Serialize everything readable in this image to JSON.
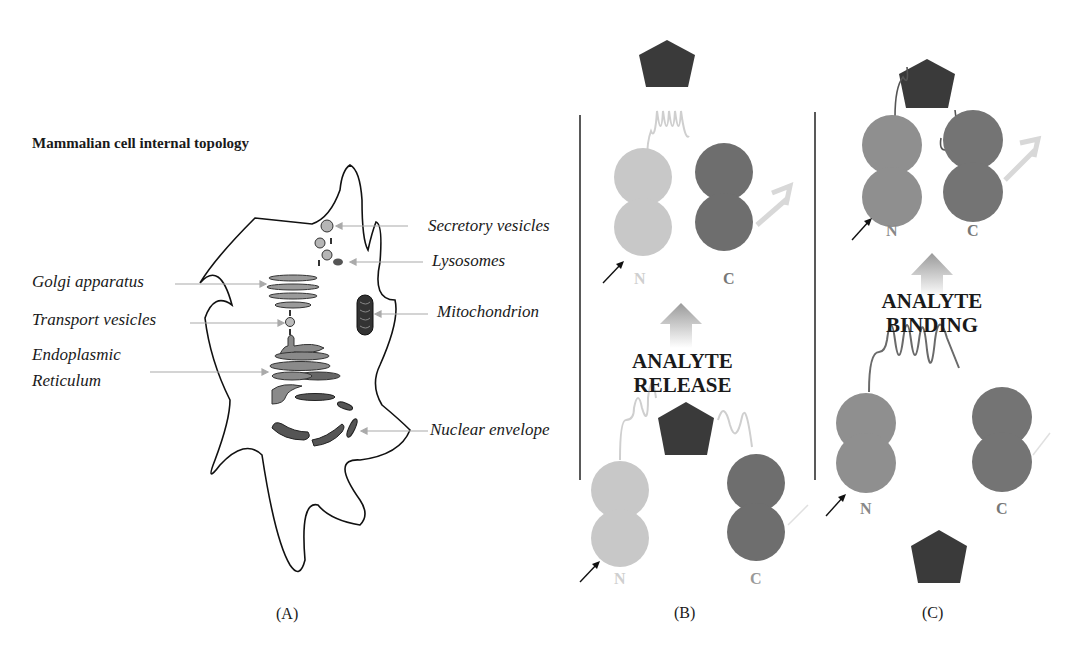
{
  "panel_a": {
    "title": "Mammalian cell internal topology",
    "caption": "(A)",
    "labels_left": [
      "Golgi apparatus",
      "Transport vesicles",
      "Endoplasmic",
      "Reticulum"
    ],
    "labels_right": [
      "Secretory vesicles",
      "Lysosomes",
      "Mitochondrion",
      "Nuclear envelope"
    ]
  },
  "panel_b": {
    "caption": "(B)",
    "event_line1": "ANALYTE",
    "event_line2": "RELEASE",
    "top": {
      "n_label": "N",
      "c_label": "C"
    },
    "bottom": {
      "n_label": "N",
      "c_label": "C"
    }
  },
  "panel_c": {
    "caption": "(C)",
    "event_line1": "ANALYTE",
    "event_line2": "BINDING",
    "top": {
      "n_label": "N",
      "c_label": "C"
    },
    "bottom": {
      "n_label": "N",
      "c_label": "C"
    }
  },
  "colors": {
    "analyte": "#3a3a3a",
    "n_light": "#c8c8c8",
    "n_mid": "#8f8f8f",
    "c_dark": "#6e6e6e",
    "linker_light": "#cfcfcf",
    "linker_dark": "#6a6a6a",
    "arrow_pale": "#d8d8d8"
  }
}
